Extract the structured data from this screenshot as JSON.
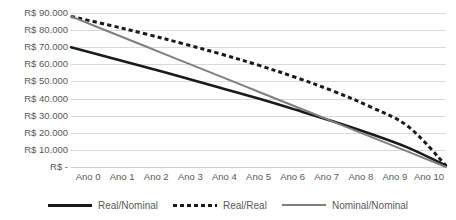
{
  "chart_data": {
    "type": "line",
    "title": "",
    "xlabel": "",
    "ylabel": "",
    "categories": [
      "Ano 0",
      "Ano 1",
      "Ano 2",
      "Ano 3",
      "Ano 4",
      "Ano 5",
      "Ano 6",
      "Ano 7",
      "Ano 8",
      "Ano 9",
      "Ano 10"
    ],
    "x": [
      0,
      1,
      2,
      3,
      4,
      5,
      6,
      7,
      8,
      9,
      10
    ],
    "ylim": [
      0,
      90000
    ],
    "ytick_values": [
      90000,
      80000,
      70000,
      60000,
      50000,
      40000,
      30000,
      20000,
      10000,
      0
    ],
    "ytick_labels": [
      "R$ 90.000",
      "R$ 80.000",
      "R$ 70.000",
      "R$ 60.000",
      "R$ 50.000",
      "R$ 40.000",
      "R$ 30.000",
      "R$ 20.000",
      "R$ 10.000",
      "R$ -"
    ],
    "grid": true,
    "legend_position": "bottom",
    "series": [
      {
        "name": "Real/Nominal",
        "style": "solid",
        "color": "#1a1a1a",
        "width": 2.6,
        "values": [
          70000,
          64200,
          58300,
          52300,
          46200,
          40000,
          33400,
          26600,
          19300,
          11200,
          800
        ]
      },
      {
        "name": "Real/Real",
        "style": "dotted",
        "color": "#1a1a1a",
        "width": 3.0,
        "values": [
          88000,
          83000,
          77700,
          72000,
          66000,
          59500,
          52300,
          44300,
          35000,
          23500,
          800
        ]
      },
      {
        "name": "Nominal/Nominal",
        "style": "solid",
        "color": "#7f7f7f",
        "width": 2.0,
        "values": [
          88000,
          79200,
          70400,
          61600,
          52800,
          44000,
          35200,
          26400,
          17600,
          8800,
          0
        ]
      }
    ]
  },
  "legend": {
    "items": [
      {
        "label": "Real/Nominal",
        "swatch": "line-solid-thick-icon"
      },
      {
        "label": "Real/Real",
        "swatch": "line-dotted-icon"
      },
      {
        "label": "Nominal/Nominal",
        "swatch": "line-solid-thin-icon"
      }
    ]
  },
  "colors": {
    "series_dark": "#1a1a1a",
    "series_gray": "#7f7f7f",
    "gridline": "#d9d9d9",
    "axis_text": "#595959",
    "background": "#ffffff"
  }
}
